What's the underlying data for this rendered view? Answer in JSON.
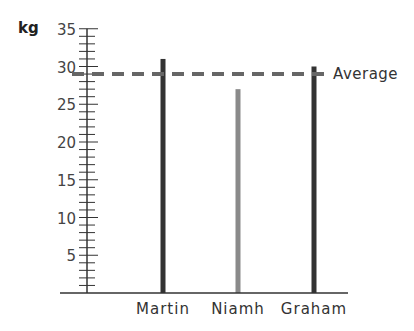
{
  "chart_data": {
    "type": "bar",
    "title": "",
    "xlabel": "",
    "ylabel": "kg",
    "ylim": [
      0,
      35
    ],
    "yticks": [
      5,
      10,
      15,
      20,
      25,
      30,
      35
    ],
    "minor_tick_step": 1,
    "grid": false,
    "categories": [
      "Martin",
      "Niamh",
      "Graham"
    ],
    "values": [
      31,
      27,
      30
    ],
    "bar_colors": [
      "#333333",
      "#8a8a8a",
      "#333333"
    ],
    "reference_line": {
      "label": "Average",
      "value": 29,
      "style": "dashed",
      "color": "#666666"
    }
  },
  "axis": {
    "unit_label": "kg"
  }
}
